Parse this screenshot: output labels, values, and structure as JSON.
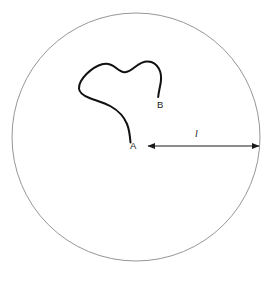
{
  "figure": {
    "type": "geometric-diagram",
    "background_color": "#ffffff",
    "circle": {
      "name": "bounding-circle",
      "center_x": 136,
      "center_y": 137,
      "radius": 124,
      "stroke_color": "#8a8a8a",
      "stroke_width": 0.9,
      "fill": "none"
    },
    "curve": {
      "name": "irregular-curve",
      "stroke_color": "#111111",
      "stroke_width": 2.0,
      "fill": "none",
      "start_point": "A",
      "end_point": "B"
    },
    "points": [
      {
        "id": "A",
        "label": "A",
        "label_x": 130,
        "label_y": 141,
        "marker_x": 130,
        "marker_y": 142
      },
      {
        "id": "B",
        "label": "B",
        "label_x": 157,
        "label_y": 100,
        "marker_x": 158,
        "marker_y": 97
      }
    ],
    "measure_arrow": {
      "name": "radius-measure-arrow",
      "label": "l",
      "label_x": 195,
      "label_y": 129,
      "x_start": 148,
      "x_end": 259,
      "y": 146,
      "stroke_color": "#1a1a1a",
      "stroke_width": 1.0,
      "double_headed": true
    }
  }
}
